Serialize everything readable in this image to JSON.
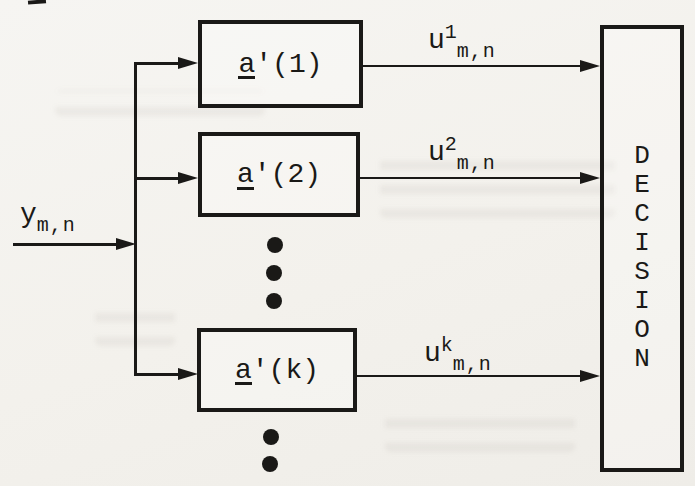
{
  "colors": {
    "ink": "#1a1917",
    "paper": "#f4f2ee"
  },
  "diagram": {
    "type": "block-diagram",
    "input_label": {
      "base": "y",
      "sub": "m,n"
    },
    "branches": [
      {
        "box_underlined": "a",
        "box_rest": "'(1)",
        "out_base": "u",
        "out_sup": "1",
        "out_sub": "m,n"
      },
      {
        "box_underlined": "a",
        "box_rest": "'(2)",
        "out_base": "u",
        "out_sup": "2",
        "out_sub": "m,n"
      },
      {
        "box_underlined": "a",
        "box_rest": "'(k)",
        "out_base": "u",
        "out_sup": "k",
        "out_sub": "m,n"
      }
    ],
    "decision_word": "DECISION",
    "decision_letters": [
      "D",
      "E",
      "C",
      "I",
      "S",
      "I",
      "O",
      "N"
    ],
    "ellipsis_between_boxes_dots": 3,
    "ellipsis_below_last_box_dots": 2
  }
}
